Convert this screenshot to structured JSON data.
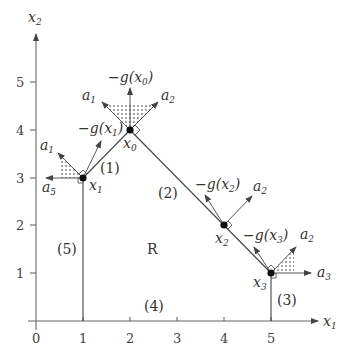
{
  "axes": {
    "x_label": "x",
    "x_label_sub": "1",
    "y_label": "x",
    "y_label_sub": "2",
    "x_ticks": [
      "0",
      "1",
      "2",
      "3",
      "4",
      "5"
    ],
    "y_ticks": [
      "1",
      "2",
      "3",
      "4",
      "5"
    ]
  },
  "region_label": "R",
  "constraints": [
    "(1)",
    "(2)",
    "(3)",
    "(4)",
    "(5)"
  ],
  "points": [
    {
      "name": "x",
      "sub": "0",
      "coords": [
        2,
        4
      ]
    },
    {
      "name": "x",
      "sub": "1",
      "coords": [
        1,
        3
      ]
    },
    {
      "name": "x",
      "sub": "2",
      "coords": [
        4,
        2
      ]
    },
    {
      "name": "x",
      "sub": "3",
      "coords": [
        5,
        1
      ]
    }
  ],
  "gradients": [
    {
      "prefix": "−g(",
      "var": "x",
      "sub": "0",
      "suffix": ")"
    },
    {
      "prefix": "−g(",
      "var": "x",
      "sub": "1",
      "suffix": ")"
    },
    {
      "prefix": "−g(",
      "var": "x",
      "sub": "2",
      "suffix": ")"
    },
    {
      "prefix": "−g(",
      "var": "x",
      "sub": "3",
      "suffix": ")"
    }
  ],
  "normals": {
    "x0": [
      {
        "name": "a",
        "sub": "1"
      },
      {
        "name": "a",
        "sub": "2"
      }
    ],
    "x1": [
      {
        "name": "a",
        "sub": "1"
      },
      {
        "name": "a",
        "sub": "5"
      }
    ],
    "x2": [
      {
        "name": "a",
        "sub": "2"
      }
    ],
    "x3": [
      {
        "name": "a",
        "sub": "2"
      },
      {
        "name": "a",
        "sub": "3"
      }
    ]
  },
  "colors": {
    "line": "#444444",
    "axis": "#666666",
    "text": "#333333",
    "dot": "#111111"
  }
}
